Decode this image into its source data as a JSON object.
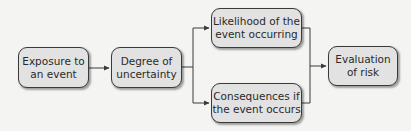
{
  "diagram": {
    "nodes": [
      {
        "id": "exposure",
        "label": "Exposure to an event",
        "line1": "Exposure to",
        "line2": "an event"
      },
      {
        "id": "uncertainty",
        "label": "Degree of uncertainty",
        "line1": "Degree of",
        "line2": "uncertainty"
      },
      {
        "id": "likelihood",
        "label": "Likelihood of the event occurring",
        "line1": "Likelihood of the",
        "line2": "event occurring"
      },
      {
        "id": "consequences",
        "label": "Consequences if the event occurs",
        "line1": "Consequences if",
        "line2": "the event occurs"
      },
      {
        "id": "evaluation",
        "label": "Evaluation of risk",
        "line1": "Evaluation",
        "line2": "of risk"
      }
    ],
    "edges": [
      {
        "from": "exposure",
        "to": "uncertainty"
      },
      {
        "from": "uncertainty",
        "to": "likelihood"
      },
      {
        "from": "uncertainty",
        "to": "consequences"
      },
      {
        "from": "likelihood",
        "to": "evaluation"
      },
      {
        "from": "consequences",
        "to": "evaluation"
      }
    ],
    "colors": {
      "box_fill": "#e2e2e2",
      "box_border": "#3a3a3a",
      "line": "#3a3a3a",
      "background": "#f4f4f2"
    }
  }
}
